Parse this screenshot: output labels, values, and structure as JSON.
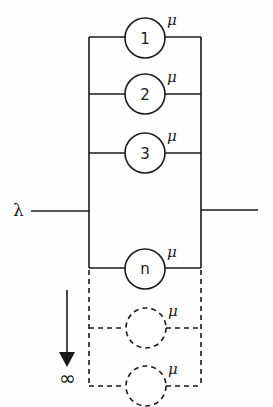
{
  "diagram": {
    "type": "queueing-system",
    "input": {
      "label": "λ"
    },
    "servers": [
      {
        "label": "1",
        "rate_label": "μ",
        "style": "solid"
      },
      {
        "label": "2",
        "rate_label": "μ",
        "style": "solid"
      },
      {
        "label": "3",
        "rate_label": "μ",
        "style": "solid"
      },
      {
        "label": "n",
        "rate_label": "μ",
        "style": "solid"
      },
      {
        "label": "",
        "rate_label": "μ",
        "style": "dashed"
      },
      {
        "label": "",
        "rate_label": "μ",
        "style": "dashed"
      }
    ],
    "extension": {
      "direction": "down",
      "label": "∞"
    }
  }
}
